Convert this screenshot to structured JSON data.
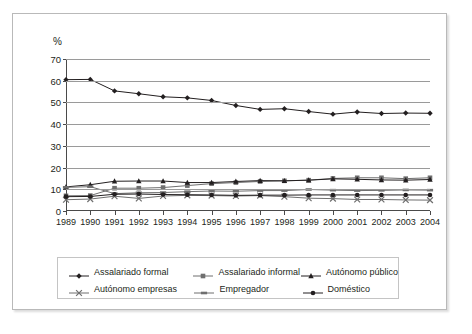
{
  "chart_data": {
    "type": "line",
    "title": "",
    "xlabel": "",
    "ylabel": "%",
    "ylim": [
      0,
      70
    ],
    "ytick_step": 10,
    "yticks": [
      "0",
      "10",
      "20",
      "30",
      "40",
      "50",
      "60",
      "70"
    ],
    "grid": true,
    "legend_position": "bottom",
    "categories": [
      "1989",
      "1990",
      "1991",
      "1992",
      "1993",
      "1994",
      "1995",
      "1996",
      "1997",
      "1998",
      "1999",
      "2000",
      "2001",
      "2002",
      "2003",
      "2004"
    ],
    "series": [
      {
        "name": "Assalariado formal",
        "marker": "diamond",
        "color": "#231f20",
        "values": [
          60.5,
          60.6,
          55.3,
          54.0,
          52.6,
          52.1,
          50.9,
          48.6,
          46.8,
          47.1,
          45.8,
          44.6,
          45.6,
          44.9,
          45.1,
          45.0
        ]
      },
      {
        "name": "Assalariado informal",
        "marker": "square",
        "color": "#6f6f6f",
        "values": [
          7.0,
          7.1,
          10.5,
          10.5,
          10.8,
          11.7,
          12.6,
          13.1,
          13.6,
          13.9,
          14.2,
          15.0,
          15.3,
          15.3,
          14.9,
          15.3
        ]
      },
      {
        "name": "Autônomo público",
        "marker": "triangle",
        "color": "#231f20",
        "values": [
          11.1,
          12.1,
          13.7,
          13.8,
          13.8,
          13.1,
          13.1,
          13.6,
          14.0,
          13.9,
          14.2,
          14.8,
          14.6,
          14.3,
          14.2,
          14.5
        ]
      },
      {
        "name": "Autônomo empresas",
        "marker": "cross",
        "color": "#6f6f6f",
        "values": [
          5.2,
          5.5,
          6.8,
          5.8,
          6.9,
          7.2,
          7.1,
          6.9,
          7.1,
          6.6,
          5.9,
          5.7,
          5.3,
          5.3,
          5.1,
          5.0
        ]
      },
      {
        "name": "Empregador",
        "marker": "dash",
        "color": "#6f6f6f",
        "values": [
          10.9,
          11.2,
          8.0,
          8.4,
          8.5,
          8.9,
          9.2,
          9.1,
          9.4,
          9.4,
          9.9,
          9.6,
          9.4,
          9.5,
          9.7,
          9.6
        ]
      },
      {
        "name": "Doméstico",
        "marker": "circle",
        "color": "#231f20",
        "values": [
          6.6,
          6.7,
          7.7,
          7.8,
          7.6,
          7.5,
          7.4,
          7.2,
          7.3,
          7.3,
          7.4,
          7.4,
          7.4,
          7.4,
          7.4,
          7.4
        ]
      }
    ]
  },
  "legend": {
    "rows": [
      [
        {
          "label": "Assalariado formal",
          "marker": "diamond",
          "color": "#231f20"
        },
        {
          "label": "Assalariado informal",
          "marker": "square",
          "color": "#6f6f6f"
        },
        {
          "label": "Autónomo público",
          "marker": "triangle",
          "color": "#231f20"
        }
      ],
      [
        {
          "label": "Autónomo empresas",
          "marker": "cross",
          "color": "#6f6f6f"
        },
        {
          "label": "Empregador",
          "marker": "dash",
          "color": "#6f6f6f"
        },
        {
          "label": "Doméstico",
          "marker": "circle",
          "color": "#231f20"
        }
      ]
    ]
  }
}
